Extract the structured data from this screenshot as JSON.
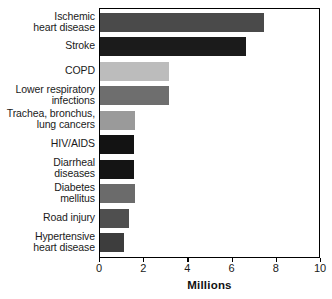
{
  "chart_data": {
    "type": "bar",
    "orientation": "horizontal",
    "title": "",
    "xlabel": "Millions",
    "ylabel": "",
    "xlim": [
      0,
      10
    ],
    "xticks": [
      0,
      2,
      4,
      6,
      8,
      10
    ],
    "xtick_labels": [
      "0",
      "2",
      "4",
      "6",
      "8",
      "10"
    ],
    "grid": false,
    "legend": false,
    "categories": [
      "Ischemic heart disease",
      "Stroke",
      "COPD",
      "Lower respiratory infections",
      "Trachea, bronchus, lung cancers",
      "HIV/AIDS",
      "Diarrheal diseases",
      "Diabetes mellitus",
      "Road injury",
      "Hypertensive heart disease"
    ],
    "values": [
      7.4,
      6.6,
      3.1,
      3.1,
      1.6,
      1.55,
      1.55,
      1.6,
      1.3,
      1.1
    ],
    "bar_colors": [
      "#4a4a4a",
      "#1b1b1b",
      "#bcbcbc",
      "#6e6e6e",
      "#9a9a9a",
      "#131313",
      "#141414",
      "#6b6b6b",
      "#4f4f4f",
      "#3d3d3d"
    ],
    "bars": [
      {
        "label_lines": [
          "Ischemic",
          "heart disease"
        ],
        "value": 7.4,
        "color": "#4a4a4a"
      },
      {
        "label_lines": [
          "Stroke"
        ],
        "value": 6.6,
        "color": "#1b1b1b"
      },
      {
        "label_lines": [
          "COPD"
        ],
        "value": 3.1,
        "color": "#bcbcbc"
      },
      {
        "label_lines": [
          "Lower respiratory",
          "infections"
        ],
        "value": 3.1,
        "color": "#6e6e6e"
      },
      {
        "label_lines": [
          "Trachea, bronchus,",
          "lung cancers"
        ],
        "value": 1.6,
        "color": "#9a9a9a"
      },
      {
        "label_lines": [
          "HIV/AIDS"
        ],
        "value": 1.55,
        "color": "#131313"
      },
      {
        "label_lines": [
          "Diarrheal",
          "diseases"
        ],
        "value": 1.55,
        "color": "#141414"
      },
      {
        "label_lines": [
          "Diabetes",
          "mellitus"
        ],
        "value": 1.6,
        "color": "#6b6b6b"
      },
      {
        "label_lines": [
          "Road injury"
        ],
        "value": 1.3,
        "color": "#4f4f4f"
      },
      {
        "label_lines": [
          "Hypertensive",
          "heart disease"
        ],
        "value": 1.1,
        "color": "#3d3d3d"
      }
    ]
  },
  "axis_title": "Millions",
  "colors": {
    "axis": "#000000",
    "text": "#1a1a1a",
    "background": "#ffffff"
  }
}
